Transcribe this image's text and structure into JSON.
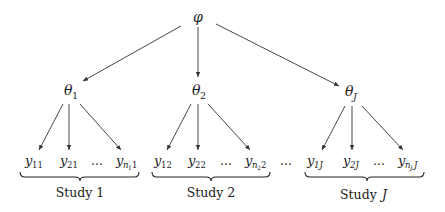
{
  "root": {
    "symbol": "φ"
  },
  "params": [
    {
      "base": "θ",
      "sub": "1"
    },
    {
      "base": "θ",
      "sub": "2"
    },
    {
      "base": "θ",
      "sub": "J"
    }
  ],
  "groups": [
    {
      "label": "Study 1",
      "obs": [
        {
          "base": "y",
          "sub": "11"
        },
        {
          "base": "y",
          "sub": "21"
        },
        {
          "base": "…",
          "sub": ""
        },
        {
          "base": "y",
          "sub": "n",
          "subsub": "1",
          "tail": "1"
        }
      ]
    },
    {
      "label": "Study 2",
      "obs": [
        {
          "base": "y",
          "sub": "12"
        },
        {
          "base": "y",
          "sub": "22"
        },
        {
          "base": "…",
          "sub": ""
        },
        {
          "base": "y",
          "sub": "n",
          "subsub": "2",
          "tail": "2"
        }
      ]
    },
    {
      "label_prefix": "Study ",
      "label_var": "J",
      "obs": [
        {
          "base": "y",
          "sub": "1J"
        },
        {
          "base": "y",
          "sub": "2J"
        },
        {
          "base": "…",
          "sub": ""
        },
        {
          "base": "y",
          "sub": "n",
          "subsub": "J",
          "tail": "J"
        }
      ]
    }
  ],
  "between_groups_ellipsis": "…"
}
